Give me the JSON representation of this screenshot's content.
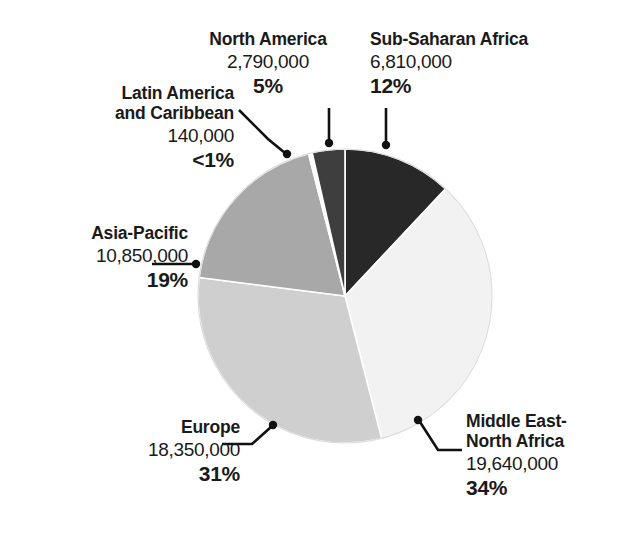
{
  "chart_data": {
    "type": "pie",
    "title": "",
    "xlabel": "",
    "ylabel": "",
    "legend_position": "none",
    "grid": false,
    "total": 58580000,
    "categories": [
      "Sub-Saharan Africa",
      "Middle East-North Africa",
      "Europe",
      "Asia-Pacific",
      "Latin America and Caribbean",
      "North America"
    ],
    "values": [
      6810000,
      19640000,
      18350000,
      10850000,
      140000,
      2790000
    ],
    "percents": [
      12,
      34,
      31,
      19,
      0.4,
      5
    ],
    "slices": [
      {
        "name": "Sub-Saharan Africa",
        "label_line1": "Sub-Saharan Africa",
        "label_line2": "",
        "value": "6,810,000",
        "percent": "12%",
        "percent_number": 12,
        "raw_value": 6810000,
        "color": "#282828",
        "start_angle": 0,
        "end_angle": 43.2
      },
      {
        "name": "Middle East-North Africa",
        "label_line1": "Middle East-",
        "label_line2": "North Africa",
        "value": "19,640,000",
        "percent": "34%",
        "percent_number": 34,
        "raw_value": 19640000,
        "color": "#f2f2f2",
        "start_angle": 43.2,
        "end_angle": 165.6
      },
      {
        "name": "Europe",
        "label_line1": "Europe",
        "label_line2": "",
        "value": "18,350,000",
        "percent": "31%",
        "percent_number": 31,
        "raw_value": 18350000,
        "color": "#cfcfcf",
        "start_angle": 165.6,
        "end_angle": 277.2
      },
      {
        "name": "Asia-Pacific",
        "label_line1": "Asia-Pacific",
        "label_line2": "",
        "value": "10,850,000",
        "percent": "19%",
        "percent_number": 19,
        "raw_value": 10850000,
        "color": "#a8a8a8",
        "start_angle": 277.2,
        "end_angle": 345.6
      },
      {
        "name": "Latin America and Caribbean",
        "label_line1": "Latin America",
        "label_line2": "and Caribbean",
        "value": "140,000",
        "percent": "<1%",
        "percent_number": 0.4,
        "raw_value": 140000,
        "color": "#fbfbfb",
        "start_angle": 345.6,
        "end_angle": 347.1
      },
      {
        "name": "North America",
        "label_line1": "North America",
        "label_line2": "",
        "value": "2,790,000",
        "percent": "5%",
        "percent_number": 5,
        "raw_value": 2790000,
        "color": "#3e3e3e",
        "start_angle": 347.1,
        "end_angle": 360
      }
    ]
  },
  "labels": {
    "north_america": {
      "name": "North America",
      "value": "2,790,000",
      "percent": "5%"
    },
    "sub_saharan_africa": {
      "name": "Sub-Saharan Africa",
      "value": "6,810,000",
      "percent": "12%"
    },
    "latin_america": {
      "name_line1": "Latin America",
      "name_line2": "and Caribbean",
      "value": "140,000",
      "percent": "<1%"
    },
    "asia_pacific": {
      "name": "Asia-Pacific",
      "value": "10,850,000",
      "percent": "19%"
    },
    "europe": {
      "name": "Europe",
      "value": "18,350,000",
      "percent": "31%"
    },
    "middle_east_north_africa": {
      "name_line1": "Middle East-",
      "name_line2": "North Africa",
      "value": "19,640,000",
      "percent": "34%"
    }
  },
  "colors": {
    "text": "#1a1a1a",
    "leader_line": "#111111",
    "background": "#ffffff",
    "slice_divider": "#ffffff"
  }
}
